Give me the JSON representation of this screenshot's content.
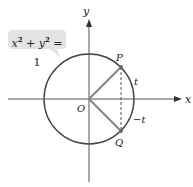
{
  "diagram": {
    "equation": {
      "lhs_x": "x",
      "lhs_y": "y",
      "exp": "2",
      "plus": " + ",
      "eq": " = 1"
    },
    "axes": {
      "x_label": "x",
      "y_label": "y"
    },
    "points": {
      "origin": "O",
      "p": "P",
      "q": "Q"
    },
    "arcs": {
      "upper": "t",
      "lower": "−t"
    },
    "colors": {
      "circle": "#444444",
      "radius": "#888888",
      "axis": "#555555",
      "label_bg": "#e4e4e4"
    }
  }
}
